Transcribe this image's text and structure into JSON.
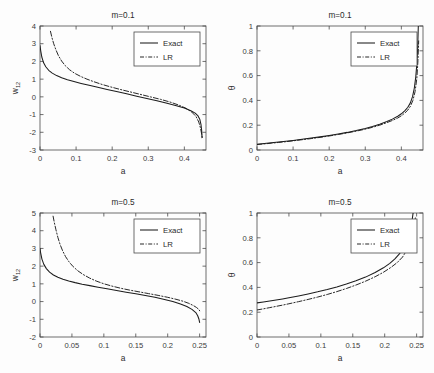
{
  "figure": {
    "name": "four-panel-comparison-figure",
    "background_color": "#fdfdfd",
    "line_color": "#1c1c1c",
    "axis_color": "#4a4a4a",
    "panel_count": 4
  },
  "chart_data": [
    {
      "id": "top-left",
      "type": "line",
      "title": "m=0.1",
      "xlabel": "a",
      "ylabel": "w_12",
      "ylabel_base": "w",
      "ylabel_sub": "12",
      "xlim": [
        0,
        0.46
      ],
      "ylim": [
        -3,
        4
      ],
      "xticks": [
        0,
        0.1,
        0.2,
        0.3,
        0.4
      ],
      "xticklabels": [
        "0",
        "0.1",
        "0.2",
        "0.3",
        "0.4"
      ],
      "yticks": [
        -3,
        -2,
        -1,
        0,
        1,
        2,
        3,
        4
      ],
      "yticklabels": [
        "-3",
        "-2",
        "-1",
        "0",
        "1",
        "2",
        "3",
        "4"
      ],
      "grid": false,
      "legend_position": "upper right",
      "series": [
        {
          "name": "Exact",
          "style": "solid",
          "x": [
            0.0,
            0.002,
            0.005,
            0.01,
            0.016,
            0.024,
            0.034,
            0.046,
            0.06,
            0.076,
            0.094,
            0.114,
            0.136,
            0.16,
            0.186,
            0.212,
            0.24,
            0.268,
            0.296,
            0.324,
            0.352,
            0.378,
            0.4,
            0.418,
            0.43,
            0.438,
            0.443,
            0.446,
            0.448,
            0.449
          ],
          "y": [
            2.9,
            2.6,
            2.25,
            1.92,
            1.7,
            1.5,
            1.34,
            1.2,
            1.08,
            0.97,
            0.87,
            0.76,
            0.65,
            0.54,
            0.42,
            0.3,
            0.17,
            0.04,
            -0.09,
            -0.22,
            -0.36,
            -0.5,
            -0.63,
            -0.78,
            -0.92,
            -1.08,
            -1.28,
            -1.55,
            -1.9,
            -2.3
          ]
        },
        {
          "name": "LR",
          "style": "dashdot",
          "x": [
            0.029,
            0.033,
            0.038,
            0.044,
            0.051,
            0.06,
            0.07,
            0.082,
            0.096,
            0.112,
            0.13,
            0.15,
            0.172,
            0.196,
            0.222,
            0.25,
            0.278,
            0.306,
            0.334,
            0.36,
            0.384,
            0.404,
            0.42,
            0.432,
            0.44,
            0.445,
            0.448,
            0.45
          ],
          "y": [
            3.7,
            3.35,
            3.0,
            2.66,
            2.33,
            2.02,
            1.76,
            1.53,
            1.33,
            1.16,
            1.0,
            0.85,
            0.7,
            0.56,
            0.42,
            0.28,
            0.14,
            0.0,
            -0.14,
            -0.29,
            -0.46,
            -0.64,
            -0.85,
            -1.1,
            -1.42,
            -1.78,
            -2.1,
            -2.35
          ]
        }
      ]
    },
    {
      "id": "top-right",
      "type": "line",
      "title": "m=0.1",
      "xlabel": "a",
      "ylabel": "θ",
      "xlim": [
        0,
        0.46
      ],
      "ylim": [
        0,
        1
      ],
      "xticks": [
        0,
        0.1,
        0.2,
        0.3,
        0.4
      ],
      "xticklabels": [
        "0",
        "0.1",
        "0.2",
        "0.3",
        "0.4"
      ],
      "yticks": [
        0,
        0.2,
        0.4,
        0.6,
        0.8,
        1
      ],
      "yticklabels": [
        "0",
        "0.2",
        "0.4",
        "0.6",
        "0.8",
        "1"
      ],
      "grid": false,
      "legend_position": "upper right",
      "series": [
        {
          "name": "Exact",
          "style": "solid",
          "x": [
            0.0,
            0.02,
            0.04,
            0.06,
            0.08,
            0.1,
            0.125,
            0.15,
            0.175,
            0.2,
            0.225,
            0.25,
            0.275,
            0.3,
            0.32,
            0.34,
            0.36,
            0.375,
            0.39,
            0.4,
            0.41,
            0.418,
            0.425,
            0.431,
            0.436,
            0.44,
            0.443,
            0.445,
            0.446,
            0.447
          ],
          "y": [
            0.047,
            0.052,
            0.058,
            0.064,
            0.07,
            0.077,
            0.086,
            0.096,
            0.106,
            0.117,
            0.129,
            0.142,
            0.157,
            0.174,
            0.19,
            0.208,
            0.23,
            0.249,
            0.272,
            0.292,
            0.318,
            0.345,
            0.38,
            0.43,
            0.5,
            0.59,
            0.7,
            0.81,
            0.9,
            1.0
          ]
        },
        {
          "name": "LR",
          "style": "dashdot",
          "x": [
            0.0,
            0.02,
            0.04,
            0.06,
            0.08,
            0.1,
            0.125,
            0.15,
            0.175,
            0.2,
            0.225,
            0.25,
            0.275,
            0.3,
            0.32,
            0.34,
            0.36,
            0.375,
            0.39,
            0.4,
            0.41,
            0.418,
            0.425,
            0.432,
            0.438,
            0.443,
            0.446,
            0.448
          ],
          "y": [
            0.044,
            0.049,
            0.055,
            0.061,
            0.067,
            0.074,
            0.083,
            0.092,
            0.102,
            0.113,
            0.125,
            0.138,
            0.152,
            0.168,
            0.183,
            0.2,
            0.221,
            0.238,
            0.258,
            0.276,
            0.299,
            0.322,
            0.352,
            0.4,
            0.47,
            0.58,
            0.72,
            0.88
          ]
        }
      ]
    },
    {
      "id": "bottom-left",
      "type": "line",
      "title": "m=0.5",
      "xlabel": "a",
      "ylabel": "w_12",
      "ylabel_base": "w",
      "ylabel_sub": "12",
      "xlim": [
        0,
        0.26
      ],
      "ylim": [
        -2,
        5
      ],
      "xticks": [
        0,
        0.05,
        0.1,
        0.15,
        0.2,
        0.25
      ],
      "xticklabels": [
        "0",
        "0.05",
        "0.1",
        "0.15",
        "0.2",
        "0.25"
      ],
      "yticks": [
        -2,
        -1,
        0,
        1,
        2,
        3,
        4,
        5
      ],
      "yticklabels": [
        "-2",
        "-1",
        "0",
        "1",
        "2",
        "3",
        "4",
        "5"
      ],
      "grid": false,
      "legend_position": "upper right",
      "series": [
        {
          "name": "Exact",
          "style": "solid",
          "x": [
            0.0,
            0.001,
            0.003,
            0.006,
            0.01,
            0.015,
            0.021,
            0.028,
            0.036,
            0.045,
            0.055,
            0.066,
            0.078,
            0.091,
            0.105,
            0.12,
            0.135,
            0.15,
            0.165,
            0.18,
            0.195,
            0.208,
            0.22,
            0.23,
            0.238,
            0.244,
            0.247,
            0.249,
            0.25
          ],
          "y": [
            3.0,
            2.75,
            2.4,
            2.1,
            1.86,
            1.66,
            1.5,
            1.37,
            1.26,
            1.16,
            1.07,
            0.98,
            0.9,
            0.81,
            0.72,
            0.62,
            0.53,
            0.44,
            0.34,
            0.24,
            0.12,
            0.0,
            -0.14,
            -0.28,
            -0.44,
            -0.62,
            -0.8,
            -1.0,
            -1.18
          ]
        },
        {
          "name": "LR",
          "style": "dashdot",
          "x": [
            0.0205,
            0.0225,
            0.025,
            0.028,
            0.0315,
            0.0355,
            0.04,
            0.0455,
            0.052,
            0.0595,
            0.068,
            0.0775,
            0.088,
            0.0995,
            0.112,
            0.1255,
            0.14,
            0.155,
            0.17,
            0.185,
            0.2,
            0.213,
            0.224,
            0.233,
            0.24,
            0.245,
            0.248,
            0.2495,
            0.25
          ],
          "y": [
            4.82,
            4.45,
            4.05,
            3.62,
            3.22,
            2.86,
            2.54,
            2.24,
            1.97,
            1.73,
            1.52,
            1.33,
            1.16,
            1.01,
            0.88,
            0.76,
            0.65,
            0.55,
            0.45,
            0.35,
            0.24,
            0.13,
            0.02,
            -0.1,
            -0.22,
            -0.33,
            -0.42,
            -0.48,
            -0.52
          ]
        }
      ]
    },
    {
      "id": "bottom-right",
      "type": "line",
      "title": "m=0.5",
      "xlabel": "a",
      "ylabel": "θ",
      "xlim": [
        0,
        0.26
      ],
      "ylim": [
        0,
        1
      ],
      "xticks": [
        0,
        0.05,
        0.1,
        0.15,
        0.2,
        0.25
      ],
      "xticklabels": [
        "0",
        "0.05",
        "0.1",
        "0.15",
        "0.2",
        "0.25"
      ],
      "yticks": [
        0,
        0.2,
        0.4,
        0.6,
        0.8,
        1
      ],
      "yticklabels": [
        "0",
        "0.2",
        "0.4",
        "0.6",
        "0.8",
        "1"
      ],
      "grid": false,
      "legend_position": "upper right",
      "series": [
        {
          "name": "Exact",
          "style": "solid",
          "x": [
            0.0,
            0.01,
            0.02,
            0.03,
            0.04,
            0.05,
            0.065,
            0.08,
            0.095,
            0.11,
            0.125,
            0.14,
            0.155,
            0.17,
            0.185,
            0.198,
            0.208,
            0.216,
            0.223,
            0.229,
            0.234,
            0.238,
            0.241,
            0.243,
            0.2445
          ],
          "y": [
            0.275,
            0.282,
            0.29,
            0.298,
            0.307,
            0.316,
            0.331,
            0.347,
            0.364,
            0.383,
            0.404,
            0.427,
            0.453,
            0.483,
            0.52,
            0.558,
            0.594,
            0.63,
            0.67,
            0.715,
            0.77,
            0.83,
            0.89,
            0.945,
            1.0
          ]
        },
        {
          "name": "LR",
          "style": "dashdot",
          "x": [
            0.0,
            0.01,
            0.02,
            0.03,
            0.04,
            0.05,
            0.065,
            0.08,
            0.095,
            0.11,
            0.125,
            0.14,
            0.155,
            0.17,
            0.185,
            0.198,
            0.21,
            0.22,
            0.228,
            0.234,
            0.239,
            0.243,
            0.246,
            0.248
          ],
          "y": [
            0.218,
            0.227,
            0.237,
            0.247,
            0.257,
            0.268,
            0.285,
            0.303,
            0.322,
            0.343,
            0.366,
            0.391,
            0.419,
            0.45,
            0.486,
            0.522,
            0.562,
            0.602,
            0.645,
            0.695,
            0.755,
            0.825,
            0.9,
            0.96
          ]
        }
      ]
    }
  ],
  "legend": {
    "exact_label": "Exact",
    "lr_label": "LR"
  }
}
